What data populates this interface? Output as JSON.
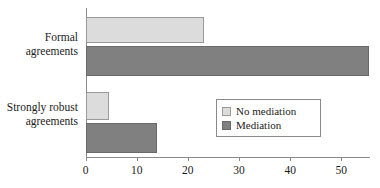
{
  "chart_data": {
    "type": "bar",
    "orientation": "horizontal",
    "title": "",
    "xlabel": "",
    "ylabel": "",
    "categories": [
      "Formal agreements",
      "Strongly robust agreements"
    ],
    "category_lines": [
      [
        "Formal",
        "agreements"
      ],
      [
        "Strongly robust",
        "agreements"
      ]
    ],
    "series": [
      {
        "name": "No mediation",
        "color": "#dcdcdc",
        "values": [
          23.2,
          4.6
        ]
      },
      {
        "name": "Mediation",
        "color": "#808080",
        "values": [
          55.5,
          14.0
        ]
      }
    ],
    "xlim": [
      0,
      55.6
    ],
    "xticks": [
      0,
      10,
      20,
      30,
      40,
      50
    ],
    "xtick_labels": [
      "0",
      "10",
      "20",
      "30",
      "40",
      "50"
    ],
    "grid": false,
    "legend_position": "center-right"
  },
  "legend": {
    "entries": [
      {
        "label": "No mediation"
      },
      {
        "label": "Mediation"
      }
    ]
  },
  "axis": {
    "tick_labels": [
      "0",
      "10",
      "20",
      "30",
      "40",
      "50"
    ]
  }
}
